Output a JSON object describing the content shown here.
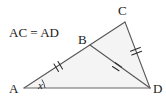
{
  "figure": {
    "given_statement": "AC = AD",
    "vertex_labels": {
      "a": "A",
      "b": "B",
      "c": "C",
      "d": "D"
    },
    "angle_label": "x",
    "colors": {
      "stroke": "#555555",
      "fill": "#f4f4f4",
      "text": "#1a1a1a",
      "tick": "#2a2a2a",
      "background": "#ffffff"
    }
  }
}
